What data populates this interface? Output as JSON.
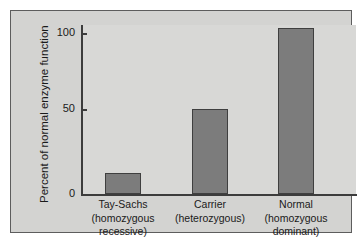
{
  "chart_data": {
    "type": "bar",
    "title": "",
    "xlabel": "",
    "ylabel": "Percent of normal enzyme function",
    "categories": [
      "Tay-Sachs",
      "Carrier",
      "Normal"
    ],
    "category_sublabels": [
      [
        "(homozygous",
        "recessive)"
      ],
      [
        "(heterozygous)"
      ],
      [
        "(homozygous",
        "dominant)"
      ]
    ],
    "values": [
      13,
      53,
      103
    ],
    "ylim": [
      0,
      110
    ],
    "yticks": [
      0,
      50,
      100
    ],
    "ytick_labels": [
      "0",
      "50",
      "100"
    ],
    "grid": false,
    "legend": "none",
    "bar_color": "#7c7c7c",
    "bar_edge_color": "#3f3f3f",
    "panel_color": "#d3d3d1",
    "plot_color": "#d8d8d6",
    "axis_color": "#3c3c3c",
    "text_color": "#1a1a1a"
  },
  "axis": {
    "y_title": "Percent of normal enzyme function",
    "ticks": [
      {
        "label": "100",
        "value": 100
      },
      {
        "label": "50",
        "value": 50
      },
      {
        "label": "0",
        "value": 0
      }
    ]
  },
  "bars": [
    {
      "name": "tay-sachs",
      "value": 13,
      "lines": [
        "Tay-Sachs",
        "(homozygous",
        "recessive)"
      ]
    },
    {
      "name": "carrier",
      "value": 53,
      "lines": [
        "Carrier",
        "(heterozygous)"
      ]
    },
    {
      "name": "normal",
      "value": 103,
      "lines": [
        "Normal",
        "(homozygous",
        "dominant)"
      ]
    }
  ]
}
